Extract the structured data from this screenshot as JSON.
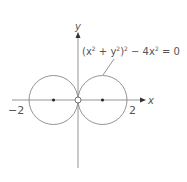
{
  "diagram": {
    "equation": "(x² + y²)² − 4x² = 0",
    "equation_parts": {
      "a": "(x",
      "b": "2",
      "c": " + y",
      "d": "2",
      "e": ")",
      "f": "2",
      "g": " − 4x",
      "h": "2",
      "i": " = 0"
    },
    "x_axis_label": "x",
    "y_axis_label": "y",
    "tick_left": "−2",
    "tick_right": "2",
    "colors": {
      "stroke": "#888888",
      "text": "#555555",
      "point": "#222222"
    }
  }
}
